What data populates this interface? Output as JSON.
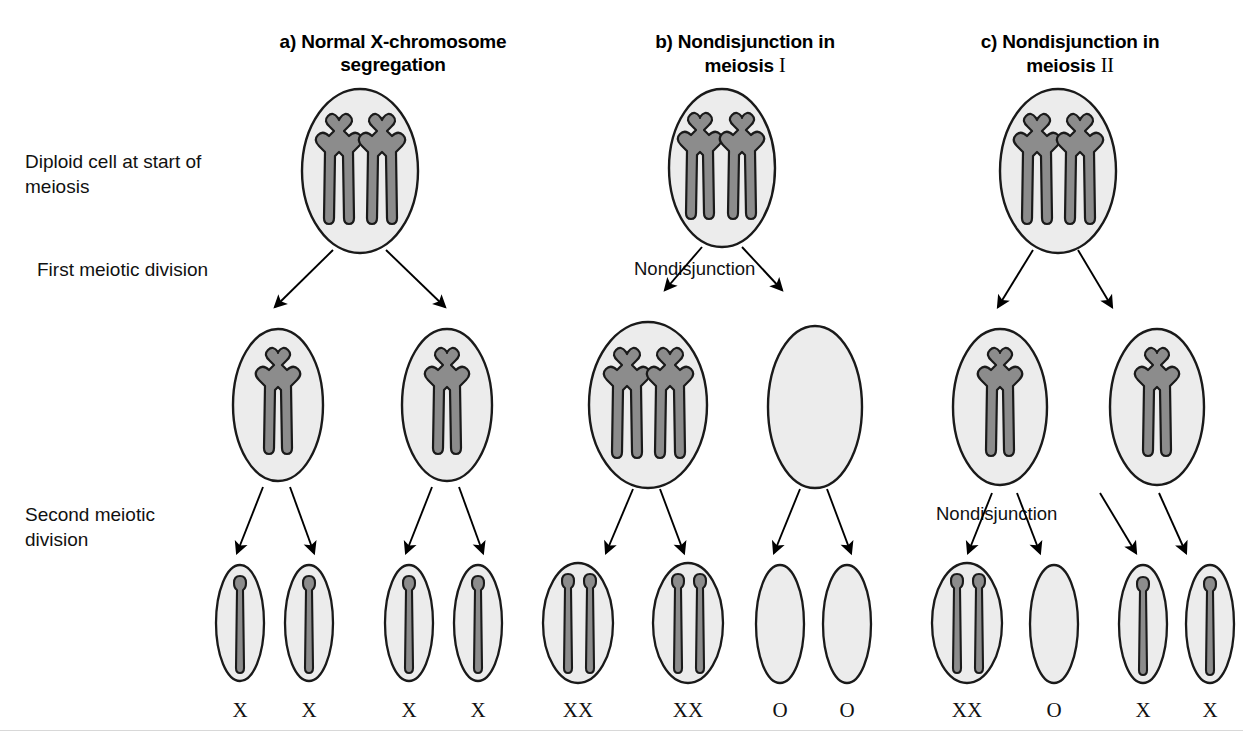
{
  "figure": {
    "kind": "biology-diagram",
    "background_color": "#ffffff",
    "cell_fill_color": "#ececec",
    "cell_stroke_color": "#1a1a1a",
    "chromosome_fill_color": "#8c8c8c",
    "chromosome_stroke_color": "#1a1a1a",
    "arrow_color": "#000000"
  },
  "row_labels": [
    {
      "id": "row-diploid",
      "line1": "Diploid cell at start of",
      "line2": "meiosis"
    },
    {
      "id": "row-first-division",
      "line1": "First meiotic division",
      "line2": ""
    },
    {
      "id": "row-second-division",
      "line1": "Second meiotic",
      "line2": "division"
    }
  ],
  "panels": [
    {
      "id": "panel-a",
      "letter": "a)",
      "title_line1": "a) Normal X-chromosome",
      "title_line2": "segregation",
      "roman": "",
      "nondisjunction_label": "",
      "parent_cell": {
        "chromosomes": 2,
        "type": "duplicated"
      },
      "secondary_cells": [
        {
          "chromosomes": 1,
          "type": "duplicated"
        },
        {
          "chromosomes": 1,
          "type": "duplicated"
        }
      ],
      "gametes": [
        {
          "label": "X",
          "chromatids": 1
        },
        {
          "label": "X",
          "chromatids": 1
        },
        {
          "label": "X",
          "chromatids": 1
        },
        {
          "label": "X",
          "chromatids": 1
        }
      ]
    },
    {
      "id": "panel-b",
      "letter": "b)",
      "title_line1": "b) Nondisjunction in",
      "title_line2": "meiosis",
      "roman": "I",
      "nondisjunction_label": "Nondisjunction",
      "nondisjunction_stage": "first",
      "parent_cell": {
        "chromosomes": 2,
        "type": "duplicated"
      },
      "secondary_cells": [
        {
          "chromosomes": 2,
          "type": "duplicated"
        },
        {
          "chromosomes": 0,
          "type": "empty"
        }
      ],
      "gametes": [
        {
          "label": "XX",
          "chromatids": 2
        },
        {
          "label": "XX",
          "chromatids": 2
        },
        {
          "label": "O",
          "chromatids": 0
        },
        {
          "label": "O",
          "chromatids": 0
        }
      ]
    },
    {
      "id": "panel-c",
      "letter": "c)",
      "title_line1": "c) Nondisjunction in",
      "title_line2": "meiosis",
      "roman": "II",
      "nondisjunction_label": "Nondisjunction",
      "nondisjunction_stage": "second",
      "parent_cell": {
        "chromosomes": 2,
        "type": "duplicated"
      },
      "secondary_cells": [
        {
          "chromosomes": 1,
          "type": "duplicated"
        },
        {
          "chromosomes": 1,
          "type": "duplicated"
        }
      ],
      "gametes": [
        {
          "label": "XX",
          "chromatids": 2
        },
        {
          "label": "O",
          "chromatids": 0
        },
        {
          "label": "X",
          "chromatids": 1
        },
        {
          "label": "X",
          "chromatids": 1
        }
      ]
    }
  ]
}
